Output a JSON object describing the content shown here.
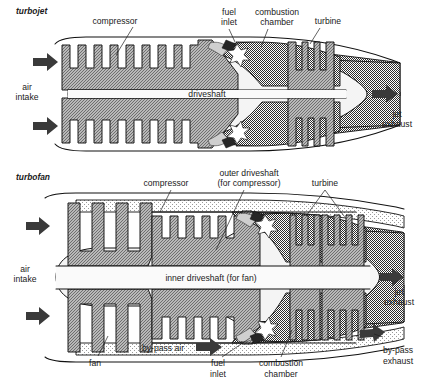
{
  "figure": {
    "background_color": "#ffffff"
  },
  "palette": {
    "ink": "#111111",
    "metal_gray": "#9c9c9c",
    "metal_gray_dark": "#8a8a8a",
    "combustion_gray": "#8f8f8f",
    "exhaust_gray": "#a6a6a6",
    "duct_light": "#efefef",
    "core_white": "#f7f7f7",
    "arrow_dark": "#3a3a3a",
    "flame_white": "#ffffff",
    "nozzle_dark": "#2a2a2a"
  },
  "turbojet": {
    "section_label": "turbojet",
    "labels": {
      "compressor": "compressor",
      "fuel_inlet_line1": "fuel",
      "fuel_inlet_line2": "inlet",
      "combustion_line1": "combustion",
      "combustion_line2": "chamber",
      "turbine": "turbine",
      "air_intake_line1": "air",
      "air_intake_line2": "intake",
      "driveshaft": "driveshaft",
      "jet_exhaust_line1": "jet",
      "jet_exhaust_line2": "exhaust"
    },
    "compressor_teeth": 8,
    "turbine_blades": 3,
    "intake_arrows": 2,
    "exhaust_arrows": 1
  },
  "turbofan": {
    "section_label": "turbofan",
    "labels": {
      "compressor": "compressor",
      "outer_driveshaft_line1": "outer driveshaft",
      "outer_driveshaft_line2": "(for compressor)",
      "turbine": "turbine",
      "air_intake_line1": "air",
      "air_intake_line2": "intake",
      "inner_driveshaft": "inner driveshaft (for fan)",
      "bypass_air": "by-pass air",
      "fan": "fan",
      "fuel_inlet_line1": "fuel",
      "fuel_inlet_line2": "inlet",
      "combustion_line1": "combustion",
      "combustion_line2": "chamber",
      "jet_exhaust_line1": "jet",
      "jet_exhaust_line2": "exhaust",
      "bypass_exhaust_line1": "by-pass",
      "bypass_exhaust_line2": "exhaust"
    },
    "fan_blades": 3,
    "compressor_teeth": 6,
    "turbine_groups": 2,
    "turbine_blades_group1": 2,
    "turbine_blades_group2": 3,
    "intake_arrows": 2,
    "exhaust_arrows": 1,
    "bypass_arrows": 2
  }
}
